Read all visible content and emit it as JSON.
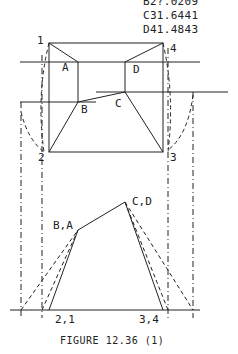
{
  "coordinates": [
    {
      "line": "B2?.0209",
      "visible": "partial"
    },
    {
      "line": "C31.6441"
    },
    {
      "line": "D41.4843"
    }
  ],
  "points_top": {
    "p1": "1",
    "p2": "2",
    "p3": "3",
    "p4": "4",
    "a": "A",
    "b": "B",
    "c": "C",
    "d": "D"
  },
  "points_bottom": {
    "ba": "B,A",
    "cd": "C,D",
    "p21": "2,1",
    "p34": "3,4"
  },
  "caption": "FIGURE 12.36 (1)",
  "colors": {
    "ink": "#222222",
    "background": "#ffffff"
  }
}
